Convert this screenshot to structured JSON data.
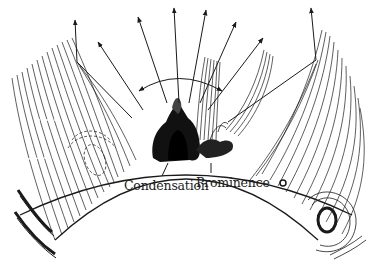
{
  "diagram": {
    "labels": {
      "condensation": "Condensation",
      "prominence": "Prominence"
    },
    "colors": {
      "ink": "#1a1a1a",
      "background": "#ffffff",
      "dark_fill": "#111111"
    },
    "limb": {
      "cx": 186,
      "cy": 560,
      "r": 385
    },
    "arrows": [
      {
        "x1": 77,
        "y1": 62,
        "x2": 75,
        "y2": 20
      },
      {
        "x1": 143,
        "y1": 110,
        "x2": 98,
        "y2": 42
      },
      {
        "x1": 167,
        "y1": 103,
        "x2": 138,
        "y2": 17
      },
      {
        "x1": 179,
        "y1": 103,
        "x2": 174,
        "y2": 8
      },
      {
        "x1": 189,
        "y1": 103,
        "x2": 206,
        "y2": 10
      },
      {
        "x1": 200,
        "y1": 103,
        "x2": 236,
        "y2": 22
      },
      {
        "x1": 208,
        "y1": 110,
        "x2": 263,
        "y2": 38
      },
      {
        "x1": 316,
        "y1": 60,
        "x2": 311,
        "y2": 8
      }
    ],
    "arc": {
      "x1": 139,
      "y1": 91,
      "cx": 178,
      "cy": 66,
      "x2": 222,
      "y2": 91
    }
  }
}
